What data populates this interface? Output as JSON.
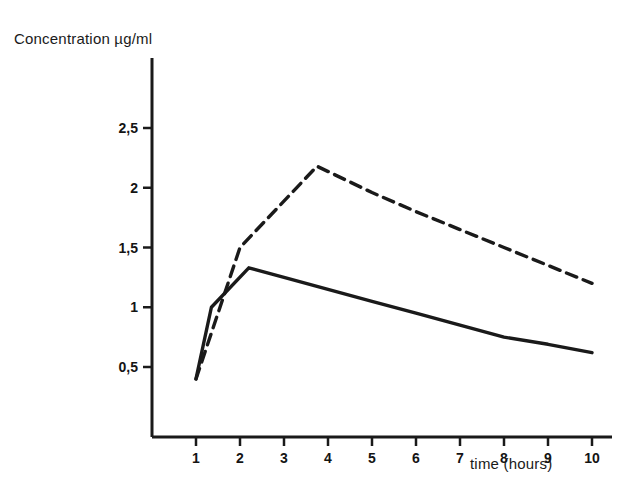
{
  "chart_data": {
    "type": "line",
    "title": "",
    "xlabel": "time (hours)",
    "ylabel": "Concentration µg/ml",
    "xlim": [
      0.0,
      10.5
    ],
    "ylim": [
      0.0,
      2.8
    ],
    "grid": false,
    "legend": "none",
    "x_ticks": [
      "1",
      "2",
      "3",
      "4",
      "5",
      "6",
      "7",
      "8",
      "9",
      "10"
    ],
    "x_tick_values": [
      1,
      2,
      3,
      4,
      5,
      6,
      7,
      8,
      9,
      10
    ],
    "y_ticks": [
      "0,5",
      "1",
      "1,5",
      "2",
      "2,5"
    ],
    "y_tick_values": [
      0.5,
      1.0,
      1.5,
      2.0,
      2.5
    ],
    "decimal_separator": ",",
    "series": [
      {
        "name": "solid-curve",
        "style": "solid",
        "color": "#1a1a1a",
        "x": [
          1.0,
          1.35,
          2.2,
          3.0,
          4.0,
          5.0,
          6.0,
          7.0,
          8.0,
          9.0,
          10.0
        ],
        "values": [
          0.4,
          1.0,
          1.33,
          1.25,
          1.15,
          1.05,
          0.95,
          0.85,
          0.75,
          0.69,
          0.62
        ]
      },
      {
        "name": "dashed-curve",
        "style": "dashed",
        "color": "#1a1a1a",
        "x": [
          1.0,
          2.0,
          3.75,
          5.0,
          6.0,
          7.0,
          8.0,
          9.0,
          10.0
        ],
        "values": [
          0.4,
          1.5,
          2.18,
          1.96,
          1.8,
          1.65,
          1.5,
          1.35,
          1.2
        ]
      }
    ]
  },
  "axes": {
    "y_title": "Concentration µg/ml",
    "x_title": "time (hours)"
  },
  "colors": {
    "background": "#ffffff",
    "ink": "#1a1a1a",
    "axis": "#1a1a1a"
  }
}
